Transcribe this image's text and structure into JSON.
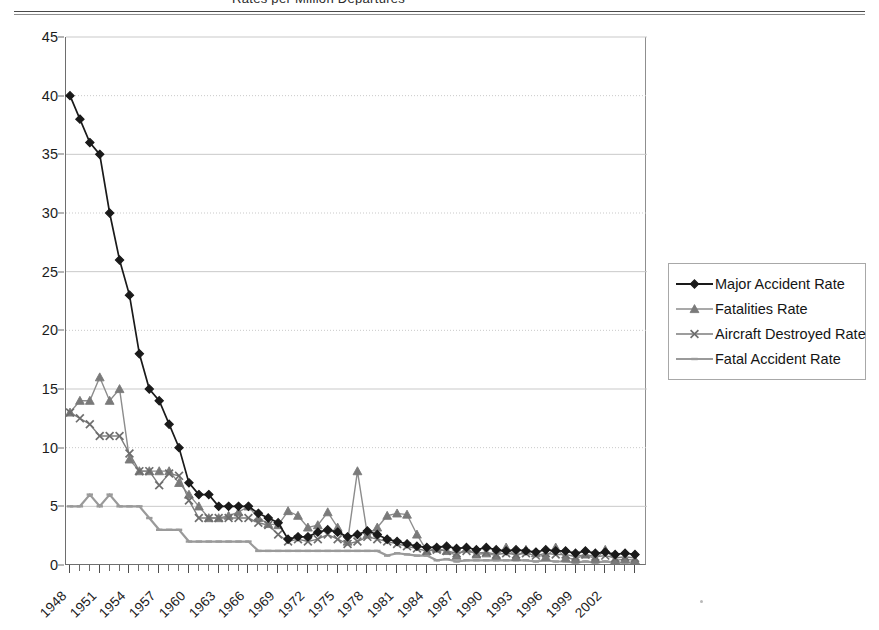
{
  "page": {
    "clipped_title_fragment": "Rates per Million Departures"
  },
  "legend": {
    "position": "right",
    "items": [
      {
        "label": "Major Accident Rate",
        "marker": "diamond-marker",
        "color": "#1a1a1a",
        "line_color": "#1a1a1a"
      },
      {
        "label": "Fatalities Rate",
        "marker": "triangle-marker",
        "color": "#7a7a7a",
        "line_color": "#8c8c8c"
      },
      {
        "label": "Aircraft Destroyed Rate",
        "marker": "x-marker",
        "color": "#6e6e6e",
        "line_color": "#7d7d7d"
      },
      {
        "label": "Fatal Accident Rate",
        "marker": "dash-marker",
        "color": "#9a9a9a",
        "line_color": "#9a9a9a"
      }
    ]
  },
  "chart_data": {
    "type": "line",
    "title": "",
    "xlabel": "",
    "ylabel": "",
    "xlim": [
      1948,
      2005
    ],
    "ylim": [
      0,
      45
    ],
    "ytick_step": 5,
    "yticks": [
      0,
      5,
      10,
      15,
      20,
      25,
      30,
      35,
      40,
      45
    ],
    "grid": "horizontal-dotted",
    "legend_position": "right",
    "xtick_labels": [
      "1948",
      "1951",
      "1954",
      "1957",
      "1960",
      "1963",
      "1966",
      "1969",
      "1972",
      "1975",
      "1978",
      "1981",
      "1984",
      "1987",
      "1990",
      "1993",
      "1996",
      "1999",
      "2002"
    ],
    "xtick_label_step": 3,
    "xtick_label_rotation": -45,
    "x": [
      1948,
      1949,
      1950,
      1951,
      1952,
      1953,
      1954,
      1955,
      1956,
      1957,
      1958,
      1959,
      1960,
      1961,
      1962,
      1963,
      1964,
      1965,
      1966,
      1967,
      1968,
      1969,
      1970,
      1971,
      1972,
      1973,
      1974,
      1975,
      1976,
      1977,
      1978,
      1979,
      1980,
      1981,
      1982,
      1983,
      1984,
      1985,
      1986,
      1987,
      1988,
      1989,
      1990,
      1991,
      1992,
      1993,
      1994,
      1995,
      1996,
      1997,
      1998,
      1999,
      2000,
      2001,
      2002,
      2003,
      2004,
      2005
    ],
    "series": [
      {
        "name": "Major Accident Rate",
        "marker": "diamond",
        "values": [
          40,
          38,
          36,
          35,
          30,
          26,
          23,
          18,
          15,
          14,
          12,
          10,
          7,
          6,
          6,
          5,
          5,
          5,
          5,
          4.4,
          4,
          3.6,
          2.2,
          2.4,
          2.4,
          2.8,
          3,
          2.8,
          2.4,
          2.6,
          2.9,
          2.6,
          2.2,
          2,
          1.8,
          1.6,
          1.5,
          1.5,
          1.6,
          1.4,
          1.5,
          1.3,
          1.5,
          1.3,
          1.2,
          1.3,
          1.2,
          1.1,
          1.3,
          1.2,
          1.2,
          1,
          1.2,
          1,
          1.1,
          0.9,
          1,
          0.9
        ]
      },
      {
        "name": "Fatalities Rate",
        "marker": "triangle",
        "values": [
          13,
          14,
          14,
          16,
          14,
          15,
          9,
          8,
          8,
          8,
          8,
          7,
          6,
          5,
          4,
          4,
          4.2,
          4.5,
          5,
          4,
          3.5,
          3.4,
          4.6,
          4.2,
          3.2,
          3.4,
          4.5,
          3.2,
          2,
          8,
          2.6,
          3.2,
          4.2,
          4.4,
          4.3,
          2.6,
          1.2,
          1.4,
          1.2,
          0.8,
          1.4,
          0.9,
          1,
          0.8,
          1.5,
          0.7,
          1.3,
          1,
          0.7,
          1.5,
          0.6,
          0.5,
          0.9,
          0.5,
          1.3,
          0.4,
          0.5,
          0.4
        ]
      },
      {
        "name": "Aircraft Destroyed Rate",
        "marker": "x",
        "values": [
          13,
          12.5,
          12,
          11,
          11,
          11,
          9.5,
          8,
          8,
          6.8,
          7.8,
          7.6,
          5.5,
          4,
          4,
          4,
          4,
          4,
          4,
          3.6,
          3.4,
          2.6,
          2,
          2.2,
          2,
          2.2,
          2.6,
          2.2,
          1.8,
          2,
          2.4,
          2.2,
          2,
          1.8,
          1.6,
          1.4,
          1.2,
          1.3,
          1.2,
          1,
          1.2,
          1,
          1.1,
          0.9,
          1,
          0.9,
          1,
          0.8,
          1,
          0.9,
          0.9,
          0.7,
          0.9,
          0.7,
          0.8,
          0.6,
          0.7,
          0.6
        ]
      },
      {
        "name": "Fatal Accident Rate",
        "marker": "dash",
        "values": [
          5,
          5,
          6,
          5,
          6,
          5,
          5,
          5,
          4,
          3,
          3,
          3,
          2,
          2,
          2,
          2,
          2,
          2,
          2,
          1.2,
          1.2,
          1.2,
          1.2,
          1.2,
          1.2,
          1.2,
          1.2,
          1.2,
          1.2,
          1.2,
          1.2,
          1.2,
          0.8,
          1,
          0.9,
          0.8,
          0.8,
          0.4,
          0.5,
          0.3,
          0.4,
          0.4,
          0.4,
          0.4,
          0.4,
          0.4,
          0.4,
          0.3,
          0.4,
          0.3,
          0.3,
          0.2,
          0.3,
          0.2,
          0.3,
          0.2,
          0.2,
          0.2
        ]
      }
    ]
  }
}
